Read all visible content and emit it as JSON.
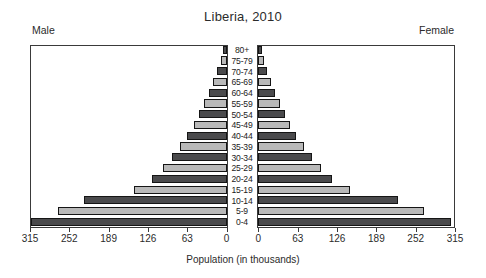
{
  "chart_data": {
    "type": "bar",
    "subtype": "population-pyramid",
    "title": "Liberia, 2010",
    "xlabel": "Population (in thousands)",
    "ylabel": "",
    "left_label": "Male",
    "right_label": "Female",
    "categories": [
      "0-4",
      "5-9",
      "10-14",
      "15-19",
      "20-24",
      "25-29",
      "30-34",
      "35-39",
      "40-44",
      "45-49",
      "50-54",
      "55-59",
      "60-64",
      "65-69",
      "70-74",
      "75-79",
      "80+"
    ],
    "xlim": [
      0,
      315
    ],
    "xticks": [
      0,
      63,
      126,
      189,
      252,
      315
    ],
    "xtick_labels_left": [
      "315",
      "252",
      "189",
      "126",
      "63",
      "0"
    ],
    "xtick_labels_right": [
      "0",
      "63",
      "126",
      "189",
      "252",
      "315"
    ],
    "grid": false,
    "legend": "none",
    "series": [
      {
        "name": "Male",
        "side": "left",
        "values": [
          313,
          270,
          228,
          149,
          120,
          102,
          88,
          75,
          63,
          52,
          44,
          36,
          28,
          21,
          15,
          9,
          5
        ]
      },
      {
        "name": "Female",
        "side": "right",
        "values": [
          308,
          265,
          224,
          147,
          118,
          100,
          86,
          73,
          61,
          51,
          43,
          35,
          27,
          20,
          14,
          9,
          6
        ]
      }
    ],
    "colors": {
      "bar_dark": "#4a4a4c",
      "bar_light": "#b9b9b9",
      "bar_outline": "#151515",
      "frame": "#3a3a3a",
      "text": "#2b2b2b",
      "background": "#ffffff"
    },
    "bar_shade_pattern": [
      "dark",
      "light",
      "dark",
      "light",
      "dark",
      "light",
      "dark",
      "light",
      "dark",
      "light",
      "dark",
      "light",
      "dark",
      "light",
      "dark",
      "light",
      "dark"
    ]
  }
}
